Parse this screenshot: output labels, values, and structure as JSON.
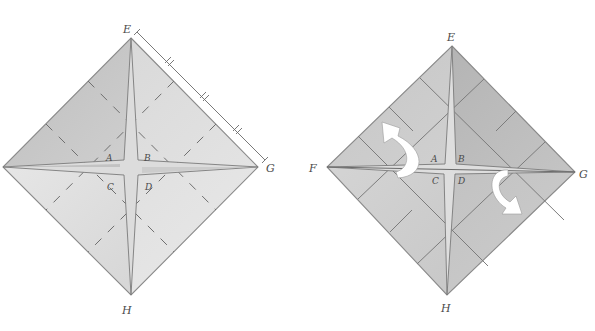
{
  "figure": {
    "colors": {
      "paper_light": "#e6e6e6",
      "paper_mid": "#d2d2d2",
      "paper_dark": "#b9b9b9",
      "line": "#7c7c7c",
      "arrow": "#ffffff",
      "label": "#4a4a4a"
    }
  },
  "left_diagram": {
    "vertex_labels": {
      "top": "E",
      "right": "G",
      "bottom": "H"
    },
    "center_labels": {
      "top_left": "A",
      "top_right": "B",
      "bottom_left": "C",
      "bottom_right": "D"
    },
    "notes": "Dashed fold lines divide each edge into thirds; edge E–G marked with a measure line divided into three equal parts (tick marks)",
    "measure_ticks": 3
  },
  "right_diagram": {
    "vertex_labels": {
      "top": "E",
      "left": "F",
      "right": "G",
      "bottom": "H"
    },
    "center_labels": {
      "top_left": "A",
      "top_right": "B",
      "bottom_left": "C",
      "bottom_right": "D"
    },
    "arrows": [
      {
        "name": "rotate-up-left-arrow",
        "direction": "counter-clockwise, upward toward upper-left"
      },
      {
        "name": "rotate-down-right-arrow",
        "direction": "clockwise, downward toward lower-right"
      }
    ]
  }
}
